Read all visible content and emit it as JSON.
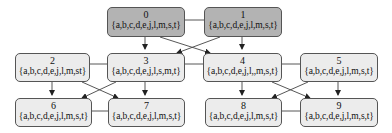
{
  "diagram": {
    "type": "state-lattice",
    "colors": {
      "dark_fill": "#b3b3b3",
      "light_fill": "#ececec",
      "border": "#555555",
      "edge": "#222222"
    },
    "nodes": [
      {
        "id": "0",
        "set": "{a,b,c,d,e,j,l,m,s,t}",
        "style": "dark"
      },
      {
        "id": "1",
        "set": "{a,b,c,d,e,j,l,m,s,t}",
        "style": "dark"
      },
      {
        "id": "2",
        "set": "{a,b,c,d,e,j,l,m,st}",
        "style": "light"
      },
      {
        "id": "3",
        "set": "{a,b,c,d,e,j,l,s,m,t}",
        "style": "light"
      },
      {
        "id": "4",
        "set": "{a,b,c,d,e,j,l,,m,s,t}",
        "style": "light"
      },
      {
        "id": "5",
        "set": "{a,b,c,d,e,j,l,m,s,t}",
        "style": "light"
      },
      {
        "id": "6",
        "set": "{a,b,c,d,e,j,l,m,s,t}",
        "style": "light"
      },
      {
        "id": "7",
        "set": "{a,b,c,d,e,j,l,m,s,t}",
        "style": "light"
      },
      {
        "id": "8",
        "set": "{a,b,c,d,e,j,l,m,s,t}",
        "style": "light"
      },
      {
        "id": "9",
        "set": "{a,b,c,d,e,j,l,m,s,t}",
        "style": "light"
      }
    ],
    "edges": [
      {
        "from": "0",
        "to": "3",
        "kind": "arrow"
      },
      {
        "from": "0",
        "to": "4",
        "kind": "arrow"
      },
      {
        "from": "1",
        "to": "3",
        "kind": "arrow"
      },
      {
        "from": "1",
        "to": "4",
        "kind": "arrow"
      },
      {
        "from": "2",
        "to": "6",
        "kind": "arrow"
      },
      {
        "from": "2",
        "to": "7",
        "kind": "arrow"
      },
      {
        "from": "3",
        "to": "6",
        "kind": "arrow"
      },
      {
        "from": "3",
        "to": "7",
        "kind": "arrow"
      },
      {
        "from": "4",
        "to": "8",
        "kind": "arrow"
      },
      {
        "from": "4",
        "to": "9",
        "kind": "arrow"
      },
      {
        "from": "5",
        "to": "8",
        "kind": "arrow"
      },
      {
        "from": "5",
        "to": "9",
        "kind": "arrow"
      },
      {
        "from": "0",
        "to": "1",
        "kind": "line"
      },
      {
        "from": "2",
        "to": "3",
        "kind": "line"
      },
      {
        "from": "3",
        "to": "4",
        "kind": "line"
      },
      {
        "from": "4",
        "to": "5",
        "kind": "line"
      },
      {
        "from": "6",
        "to": "7",
        "kind": "line"
      },
      {
        "from": "8",
        "to": "9",
        "kind": "line"
      }
    ]
  }
}
